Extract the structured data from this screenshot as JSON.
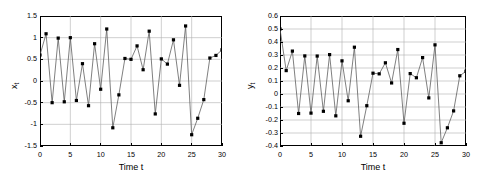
{
  "figure": {
    "background": "#ffffff",
    "line_color": "#555555",
    "marker_color": "#000000",
    "grid_color": "#b0b0b0",
    "axis_color": "#000000"
  },
  "panels": [
    {
      "id": "left",
      "ylabel_main": "x",
      "ylabel_sub": "t",
      "xlabel": "Time t",
      "yticks": [
        "1.5",
        "1",
        "0.5",
        "0",
        "-0.5",
        "-1",
        "-1.5"
      ],
      "ytick_values": [
        1.5,
        1,
        0.5,
        0,
        -0.5,
        -1,
        -1.5
      ],
      "xticks": [
        "0",
        "5",
        "10",
        "15",
        "20",
        "25",
        "30"
      ],
      "xtick_values": [
        0,
        5,
        10,
        15,
        20,
        25,
        30
      ]
    },
    {
      "id": "right",
      "ylabel_main": "y",
      "ylabel_sub": "t",
      "xlabel": "Time t",
      "yticks": [
        "0.6",
        "0.5",
        "0.4",
        "0.3",
        "0.2",
        "0.1",
        "0",
        "-0.1",
        "-0.2",
        "-0.3",
        "-0.4"
      ],
      "ytick_values": [
        0.6,
        0.5,
        0.4,
        0.3,
        0.2,
        0.1,
        0,
        -0.1,
        -0.2,
        -0.3,
        -0.4
      ],
      "xticks": [
        "0",
        "5",
        "10",
        "15",
        "20",
        "25",
        "30"
      ],
      "xtick_values": [
        0,
        5,
        10,
        15,
        20,
        25,
        30
      ]
    }
  ],
  "chart_data": [
    {
      "type": "line",
      "title": "",
      "xlabel": "Time t",
      "ylabel": "x_t",
      "xlim": [
        0,
        30
      ],
      "ylim": [
        -1.5,
        1.5
      ],
      "grid": true,
      "legend": "none",
      "marker": "filled-square",
      "x": [
        0,
        1,
        2,
        3,
        4,
        5,
        6,
        7,
        8,
        9,
        10,
        11,
        12,
        13,
        14,
        15,
        16,
        17,
        18,
        19,
        20,
        21,
        22,
        23,
        24,
        25,
        26,
        27,
        28,
        29,
        30
      ],
      "values": [
        0.6,
        1.09,
        -0.5,
        0.99,
        -0.48,
        1.0,
        -0.45,
        0.4,
        -0.57,
        0.86,
        -0.19,
        1.2,
        -1.08,
        -0.32,
        0.52,
        0.5,
        0.81,
        0.26,
        1.15,
        -0.76,
        0.51,
        0.39,
        0.95,
        -0.1,
        1.27,
        -1.24,
        -0.86,
        -0.43,
        0.53,
        0.59,
        0.72
      ]
    },
    {
      "type": "line",
      "title": "",
      "xlabel": "Time t",
      "ylabel": "y_t",
      "xlim": [
        0,
        30
      ],
      "ylim": [
        -0.4,
        0.6
      ],
      "grid": true,
      "legend": "none",
      "marker": "filled-square",
      "x": [
        0,
        1,
        2,
        3,
        4,
        5,
        6,
        7,
        8,
        9,
        10,
        11,
        12,
        13,
        14,
        15,
        16,
        17,
        18,
        19,
        20,
        21,
        22,
        23,
        24,
        25,
        26,
        27,
        28,
        29,
        30
      ],
      "values": [
        0.5,
        0.18,
        0.33,
        -0.15,
        0.293,
        -0.147,
        0.292,
        -0.133,
        0.303,
        -0.168,
        0.255,
        -0.052,
        0.36,
        -0.325,
        -0.09,
        0.16,
        0.155,
        0.24,
        0.085,
        0.342,
        -0.225,
        0.157,
        0.125,
        0.28,
        -0.03,
        0.378,
        -0.375,
        -0.26,
        -0.13,
        0.14,
        0.175
      ]
    }
  ]
}
